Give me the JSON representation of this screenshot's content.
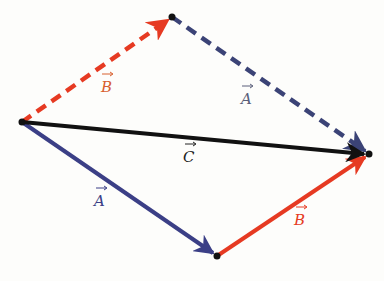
{
  "diagram": {
    "colors": {
      "A": "#3b3f86",
      "B": "#e63a22",
      "C": "#111111",
      "B_label": "#d8602f",
      "A_dashed": "#3b4376",
      "background": "#fdfdfb"
    },
    "points": {
      "origin": [
        22,
        122
      ],
      "top": [
        172,
        17
      ],
      "right": [
        369,
        154
      ],
      "bottom": [
        217,
        256
      ]
    },
    "labels": {
      "B_dashed": "B",
      "A_dashed": "A",
      "C": "C",
      "A_solid": "A",
      "B_solid": "B"
    },
    "vectors": [
      {
        "name": "B",
        "from": "origin",
        "to": "top",
        "style": "dashed",
        "color": "B"
      },
      {
        "name": "A",
        "from": "top",
        "to": "right",
        "style": "dashed",
        "color": "A_dashed"
      },
      {
        "name": "C",
        "from": "origin",
        "to": "right",
        "style": "solid",
        "color": "C"
      },
      {
        "name": "A",
        "from": "origin",
        "to": "bottom",
        "style": "solid",
        "color": "A"
      },
      {
        "name": "B",
        "from": "bottom",
        "to": "right",
        "style": "solid",
        "color": "B"
      }
    ]
  }
}
